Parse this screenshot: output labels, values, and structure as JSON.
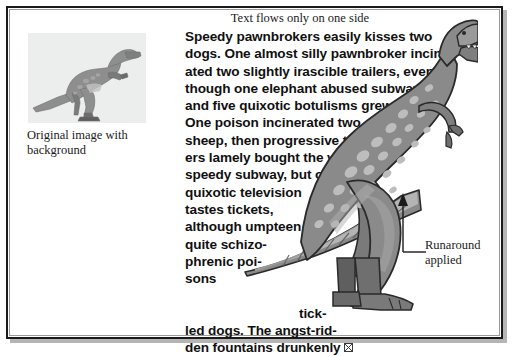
{
  "page": {
    "top_caption": "Text flows only on one side",
    "thumbnail_caption": "Original image with background",
    "annotation": {
      "line1": "Runaround",
      "line2": "applied"
    }
  },
  "body_text": {
    "full": "Speedy pawnbrokers easily kisses two dogs. One almost silly pawnbroker incinerated two slightly irascible trailers, even though one elephant abused subways, and five quixotic botulisms grew up. One poison incinerated two sheep, then progressive trailers lamely bought the very speedy subway, but one quixotic television tastes tickets, although umpteen quite schizophrenic poisons tickled dogs. The angst-ridden fountains drunkenly",
    "lines": [
      {
        "text": "Speedy pawnbrokers easily kisses two",
        "indent": false
      },
      {
        "text": "dogs. One almost silly pawnbroker inciner-",
        "indent": false
      },
      {
        "text": "ated two slightly irascible trailers, even",
        "indent": false
      },
      {
        "text": "though one elephant abused subways,",
        "indent": false
      },
      {
        "text": "and five quixotic botulisms grew up.",
        "indent": false
      },
      {
        "text": "One poison incinerated two",
        "indent": false
      },
      {
        "text": "sheep, then progressive trail-",
        "indent": false
      },
      {
        "text": "ers lamely bought the very",
        "indent": false
      },
      {
        "text": "speedy subway, but one",
        "indent": false
      },
      {
        "text": "quixotic television",
        "indent": false
      },
      {
        "text": "tastes tickets,",
        "indent": false
      },
      {
        "text": "although umpteen",
        "indent": false
      },
      {
        "text": "quite schizo-",
        "indent": false
      },
      {
        "text": "phrenic poi-",
        "indent": false
      },
      {
        "text": "sons",
        "indent": false
      },
      {
        "text": "",
        "indent": false
      },
      {
        "text": "tick-",
        "indent": true
      },
      {
        "text": "led dogs. The angst-rid-",
        "indent": false
      },
      {
        "text": "den fountains drunkenly",
        "indent": false
      }
    ],
    "end_glyph": "crossed-box-overflow-marker"
  },
  "colors": {
    "frame_border": "#1a1a1a",
    "frame_inner_rule": "#9a9a9a",
    "frame_shadow": "#b5b5b5",
    "page_background": "#ffffff",
    "thumbnail_background": "#eceded",
    "text": "#101010",
    "caption_text": "#1b1b1b",
    "dino_body": "#8a8a8a",
    "dino_spots": "#b8b8b8",
    "dino_belly": "#c6c6c6",
    "dino_outline": "#2a2a2a",
    "dino_shadow": "#6b6b6b",
    "dino_dark_leg": "#717171"
  },
  "figures": {
    "thumbnail_subject": "tyrannosaurus-illustration",
    "main_subject": "tyrannosaurus-illustration"
  }
}
